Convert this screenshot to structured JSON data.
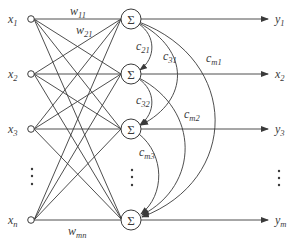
{
  "diagram": {
    "inputs": [
      {
        "label": "x",
        "sub": "1"
      },
      {
        "label": "x",
        "sub": "2"
      },
      {
        "label": "x",
        "sub": "3"
      },
      {
        "label": "x",
        "sub": "n"
      }
    ],
    "outputs": [
      {
        "label": "y",
        "sub": "1"
      },
      {
        "label": "x",
        "sub": "2"
      },
      {
        "label": "y",
        "sub": "3"
      },
      {
        "label": "y",
        "sub": "m"
      }
    ],
    "summation_symbol": "Σ",
    "weights": [
      {
        "label": "w",
        "sub": "11"
      },
      {
        "label": "w",
        "sub": "21"
      },
      {
        "label": "w",
        "sub": "mn"
      }
    ],
    "lateral_connections": [
      {
        "label": "c",
        "sub": "21"
      },
      {
        "label": "c",
        "sub": "31"
      },
      {
        "label": "c",
        "sub": "m1"
      },
      {
        "label": "c",
        "sub": "32"
      },
      {
        "label": "c",
        "sub": "m2"
      },
      {
        "label": "c",
        "sub": "m3"
      }
    ],
    "ellipsis": "⋮",
    "stroke_color": "#3a3a3a"
  }
}
